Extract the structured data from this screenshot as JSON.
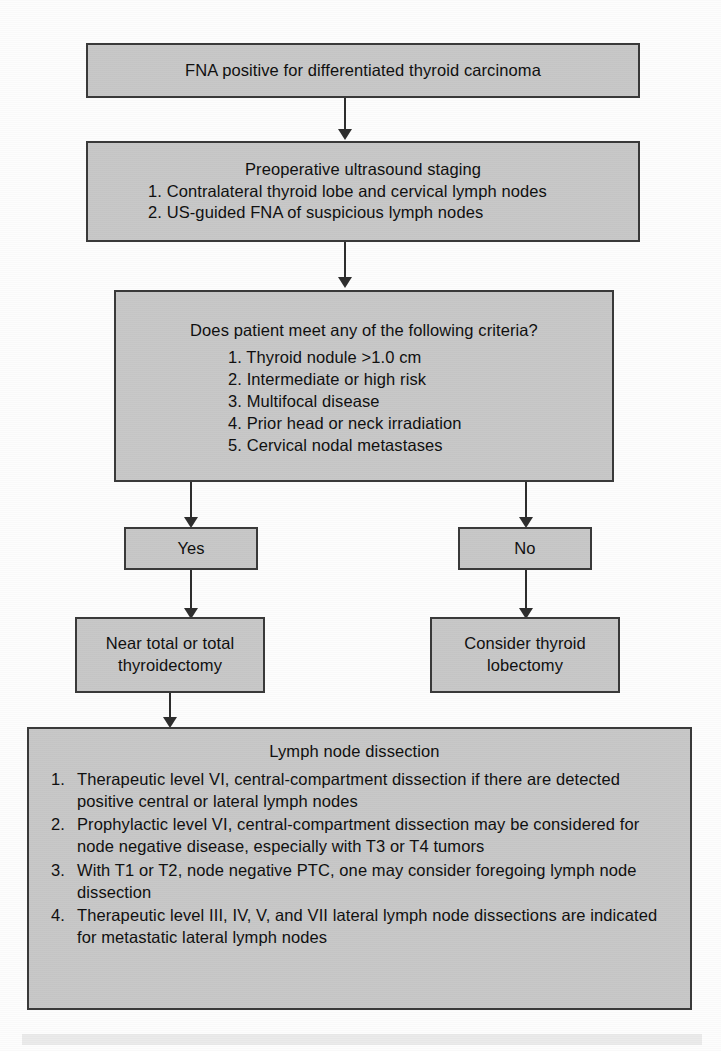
{
  "diagram": {
    "colors": {
      "box_fill": "#c8c8c8",
      "box_border": "#3a3a3a",
      "connector": "#2e2e2e",
      "page_background": "#fdfdfd",
      "footer_band": "#ebebeb"
    },
    "nodes": {
      "fna": {
        "label": "FNA positive for differentiated thyroid carcinoma"
      },
      "staging": {
        "heading": "Preoperative ultrasound staging",
        "items": [
          "1. Contralateral thyroid lobe and cervical lymph nodes",
          "2. US-guided FNA of suspicious lymph nodes"
        ]
      },
      "criteria": {
        "question": "Does patient meet any of the following criteria?",
        "items": [
          "1. Thyroid nodule >1.0 cm",
          "2. Intermediate or high risk",
          "3. Multifocal disease",
          "4. Prior head or neck irradiation",
          "5. Cervical nodal metastases"
        ]
      },
      "yes": {
        "label": "Yes"
      },
      "no": {
        "label": "No"
      },
      "total_thyroidectomy": {
        "line1": "Near total or total",
        "line2": "thyroidectomy"
      },
      "lobectomy": {
        "line1": "Consider thyroid",
        "line2": "lobectomy"
      },
      "dissection": {
        "heading": "Lymph node dissection",
        "items": [
          {
            "num": "1.",
            "text": "Therapeutic level VI, central-compartment dissection if there are detected positive central or lateral lymph nodes"
          },
          {
            "num": "2.",
            "text": "Prophylactic level VI, central-compartment dissection may be considered for node negative disease, especially with T3 or T4 tumors"
          },
          {
            "num": "3.",
            "text": "With T1 or T2, node negative PTC, one may consider foregoing lymph node dissection"
          },
          {
            "num": "4.",
            "text": "Therapeutic level III, IV, V, and VII lateral lymph node dissections are indicated for metastatic lateral lymph nodes"
          }
        ]
      }
    },
    "connectors": [
      {
        "name": "fna-to-staging",
        "kind": "arrow-down"
      },
      {
        "name": "staging-to-criteria",
        "kind": "arrow-down"
      },
      {
        "name": "criteria-to-yes",
        "kind": "arrow-down"
      },
      {
        "name": "criteria-to-no",
        "kind": "arrow-down"
      },
      {
        "name": "yes-to-thyroidectomy",
        "kind": "arrow-down"
      },
      {
        "name": "no-to-lobectomy",
        "kind": "arrow-down"
      },
      {
        "name": "thyroidectomy-to-dissection",
        "kind": "arrow-down"
      }
    ]
  }
}
